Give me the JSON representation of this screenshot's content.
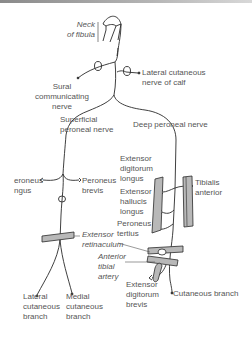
{
  "diagram": {
    "title": "",
    "colors": {
      "line": "#2a2a2a",
      "text": "#555555",
      "muscle_fill": "#b8b8b8",
      "background": "#ffffff"
    },
    "labels": {
      "neck_of_fibula": [
        "Neck",
        "of fibula"
      ],
      "sural_communicating_nerve": [
        "Sural",
        "communicating",
        "nerve"
      ],
      "lateral_cutaneous_nerve_of_calf": [
        "Lateral cutaneous",
        "nerve of calf"
      ],
      "superficial_peroneal_nerve": [
        "Superficial",
        "peroneal nerve"
      ],
      "deep_peroneal_nerve": "Deep peroneal nerve",
      "peroneus_longus": [
        "eroneus",
        "ngus"
      ],
      "peroneus_brevis": [
        "Peroneus",
        "brevis"
      ],
      "extensor_digitorum_longus": [
        "Extensor",
        "digitorum",
        "longus"
      ],
      "extensor_hallucis_longus": [
        "Extensor",
        "hallucis",
        "longus"
      ],
      "peroneus_tertius": [
        "Peroneus",
        "tertius"
      ],
      "tibialis_anterior": [
        "Tibialis",
        "anterior"
      ],
      "extensor_retinaculum": [
        "Extensor",
        "retinaculum"
      ],
      "anterior_tibial_artery": [
        "Anterior",
        "tibial",
        "artery"
      ],
      "extensor_digitorum_brevis": [
        "Extensor",
        "digitorum",
        "brevis"
      ],
      "lateral_cutaneous_branch": [
        "Lateral",
        "cutaneous",
        "branch"
      ],
      "medial_cutaneous_branch": [
        "Medial",
        "cutaneous",
        "branch"
      ],
      "cutaneous_branch": "Cutaneous branch"
    }
  }
}
